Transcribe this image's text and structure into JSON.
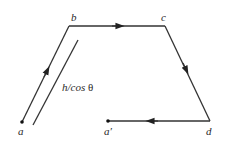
{
  "diagram": {
    "colors": {
      "line": "#333333",
      "text": "#2a2a2a",
      "background": "#ffffff"
    },
    "points": {
      "a": {
        "label": "a",
        "x": 22,
        "y": 122
      },
      "b": {
        "label": "b",
        "x": 69,
        "y": 26
      },
      "c": {
        "label": "c",
        "x": 165,
        "y": 26
      },
      "d": {
        "label": "d",
        "x": 210,
        "y": 121
      },
      "a_prime": {
        "label": "a′",
        "x": 108,
        "y": 121
      }
    },
    "segments": [
      {
        "from": "a",
        "to": "b",
        "arrow": "forward"
      },
      {
        "from": "b",
        "to": "c",
        "arrow": "forward"
      },
      {
        "from": "c",
        "to": "d",
        "arrow": "forward"
      },
      {
        "from": "d",
        "to": "a_prime",
        "arrow": "forward"
      }
    ],
    "length_marker": {
      "label_main": "h/cos ",
      "label_symbol": "θ",
      "description": "parallel line beside segment ab indicating its length"
    }
  }
}
